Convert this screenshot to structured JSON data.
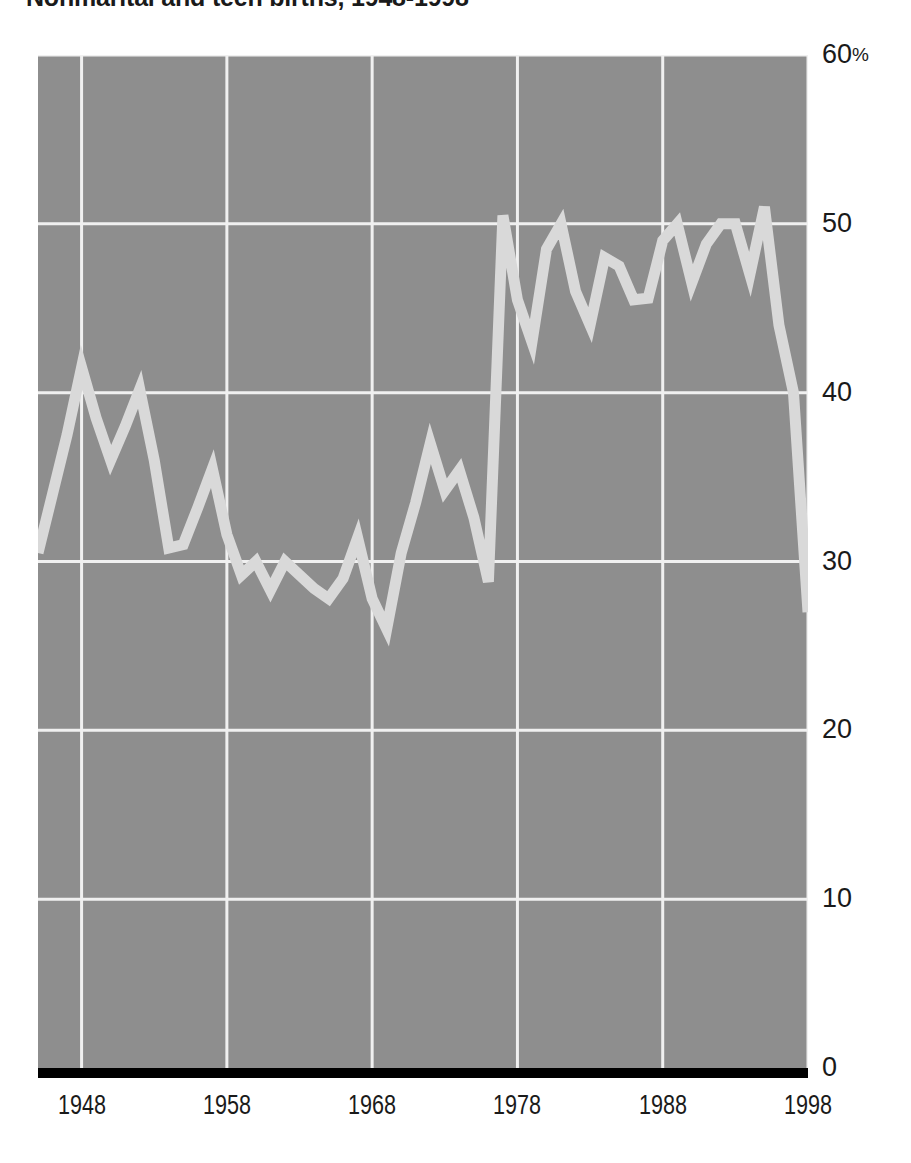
{
  "title": "Nonmarital and teen births, 1948-1998",
  "colors": {
    "plot_background": "#8e8e8e",
    "grid": "#f0f0f0",
    "series_line": "#d9d9d9",
    "baseline": "#000000",
    "text": "#1a1a1a",
    "page_background": "#ffffff"
  },
  "axes": {
    "y_ticks": [
      {
        "value": 60,
        "label": "60",
        "suffix": "%"
      },
      {
        "value": 50,
        "label": "50",
        "suffix": ""
      },
      {
        "value": 40,
        "label": "40",
        "suffix": ""
      },
      {
        "value": 30,
        "label": "30",
        "suffix": ""
      },
      {
        "value": 20,
        "label": "20",
        "suffix": ""
      },
      {
        "value": 10,
        "label": "10",
        "suffix": ""
      },
      {
        "value": 0,
        "label": "0",
        "suffix": ""
      }
    ],
    "x_ticks": [
      {
        "value": 1948,
        "label": "1948"
      },
      {
        "value": 1958,
        "label": "1958"
      },
      {
        "value": 1968,
        "label": "1968"
      },
      {
        "value": 1978,
        "label": "1978"
      },
      {
        "value": 1988,
        "label": "1988"
      },
      {
        "value": 1998,
        "label": "1998"
      }
    ]
  },
  "chart_data": {
    "type": "line",
    "title": "Nonmarital and teen births, 1948-1998",
    "xlabel": "",
    "ylabel": "",
    "xlim": [
      1945,
      1998
    ],
    "ylim": [
      0,
      60
    ],
    "y_unit": "percent",
    "grid": true,
    "legend": "none",
    "x": [
      1945,
      1946,
      1947,
      1948,
      1949,
      1950,
      1951,
      1952,
      1953,
      1954,
      1955,
      1956,
      1957,
      1958,
      1959,
      1960,
      1961,
      1962,
      1963,
      1964,
      1965,
      1966,
      1967,
      1968,
      1969,
      1970,
      1971,
      1972,
      1973,
      1974,
      1975,
      1976,
      1977,
      1978,
      1979,
      1980,
      1981,
      1982,
      1983,
      1984,
      1985,
      1986,
      1987,
      1988,
      1989,
      1990,
      1991,
      1992,
      1993,
      1994,
      1995,
      1996,
      1997,
      1998
    ],
    "series": [
      {
        "name": "Percent",
        "values": [
          30.5,
          34.0,
          37.5,
          41.5,
          38.5,
          36.0,
          38.0,
          40.2,
          36.0,
          30.8,
          31.0,
          33.2,
          35.5,
          31.6,
          29.2,
          30.0,
          28.3,
          30.0,
          29.2,
          28.4,
          27.8,
          29.0,
          31.4,
          27.8,
          26.0,
          30.5,
          33.5,
          37.0,
          34.2,
          35.4,
          32.6,
          28.8,
          50.5,
          45.5,
          43.0,
          48.5,
          50.0,
          46.0,
          44.0,
          48.0,
          47.5,
          45.5,
          45.6,
          49.0,
          50.0,
          46.5,
          48.8,
          50.0,
          50.0,
          47.0,
          51.0,
          44.0,
          40.0,
          27.0
        ]
      }
    ]
  }
}
